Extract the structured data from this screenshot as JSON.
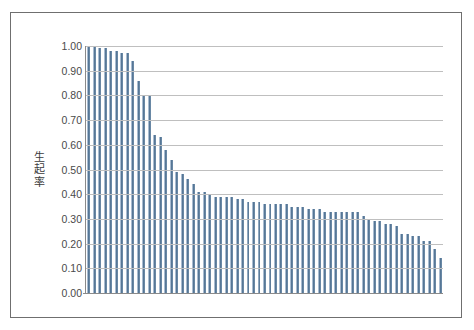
{
  "chart_data": {
    "type": "bar",
    "title": "",
    "xlabel": "",
    "ylabel": "生起率",
    "ylim": [
      0.0,
      1.0
    ],
    "grid": true,
    "legend": "none",
    "bar_color": "#4f6f8f",
    "frame_color": "#6f6f6f",
    "gridline_color": "#bfbfbf",
    "ytick_labels": [
      "1.00",
      "0.90",
      "0.80",
      "0.70",
      "0.60",
      "0.50",
      "0.40",
      "0.30",
      "0.20",
      "0.10",
      "0.00"
    ],
    "ytick_values": [
      1.0,
      0.9,
      0.8,
      0.7,
      0.6,
      0.5,
      0.4,
      0.3,
      0.2,
      0.1,
      0.0
    ],
    "xtick_labels": [],
    "categories": [
      "1",
      "2",
      "3",
      "4",
      "5",
      "6",
      "7",
      "8",
      "9",
      "10",
      "11",
      "12",
      "13",
      "14",
      "15",
      "16",
      "17",
      "18",
      "19",
      "20",
      "21",
      "22",
      "23",
      "24",
      "25",
      "26",
      "27",
      "28",
      "29",
      "30",
      "31",
      "32",
      "33",
      "34",
      "35",
      "36",
      "37",
      "38",
      "39",
      "40",
      "41",
      "42",
      "43",
      "44",
      "45",
      "46",
      "47",
      "48",
      "49",
      "50",
      "51",
      "52",
      "53",
      "54",
      "55",
      "56",
      "57",
      "58",
      "59",
      "60",
      "61",
      "62",
      "63",
      "64",
      "65"
    ],
    "values": [
      1.0,
      1.0,
      0.99,
      0.99,
      0.98,
      0.98,
      0.97,
      0.97,
      0.94,
      0.86,
      0.8,
      0.8,
      0.64,
      0.63,
      0.58,
      0.54,
      0.49,
      0.48,
      0.46,
      0.44,
      0.41,
      0.41,
      0.4,
      0.39,
      0.39,
      0.39,
      0.39,
      0.38,
      0.38,
      0.37,
      0.37,
      0.37,
      0.36,
      0.36,
      0.36,
      0.36,
      0.36,
      0.35,
      0.35,
      0.35,
      0.34,
      0.34,
      0.34,
      0.33,
      0.33,
      0.33,
      0.33,
      0.33,
      0.33,
      0.33,
      0.31,
      0.3,
      0.29,
      0.29,
      0.28,
      0.28,
      0.27,
      0.24,
      0.24,
      0.23,
      0.23,
      0.21,
      0.21,
      0.18,
      0.14
    ]
  }
}
